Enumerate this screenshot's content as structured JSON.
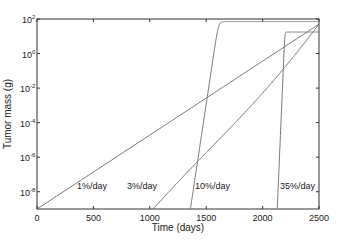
{
  "chart_data": {
    "type": "line",
    "title": "",
    "xlabel": "Time (days)",
    "ylabel": "Tumor mass (g)",
    "xlim": [
      0,
      2500
    ],
    "ylim_log10": [
      -9,
      2
    ],
    "yscale": "log",
    "grid": false,
    "legend": "none (inline curve labels)",
    "x_ticks": [
      0,
      500,
      1000,
      1500,
      2000,
      2500
    ],
    "x_tick_labels": [
      "0",
      "500",
      "1000",
      "1500",
      "2000",
      "2500"
    ],
    "y_ticks_log10": [
      2,
      0,
      -2,
      -4,
      -6,
      -8
    ],
    "y_tick_labels": [
      {
        "base": "10",
        "exp": "2"
      },
      {
        "base": "10",
        "exp": "0"
      },
      {
        "base": "10",
        "exp": "-2"
      },
      {
        "base": "10",
        "exp": "-4"
      },
      {
        "base": "10",
        "exp": "-6"
      },
      {
        "base": "10",
        "exp": "-8"
      }
    ],
    "series": [
      {
        "name": "1%/day",
        "rate_per_day": 0.01,
        "start_day": 0,
        "start_log10_mass": -9,
        "end_day": 2500,
        "end_log10_mass": 1.7,
        "color": "#555555"
      },
      {
        "name": "3%/day",
        "rate_per_day": 0.03,
        "start_day": 1030,
        "start_log10_mass": -9,
        "end_day": 2500,
        "end_log10_mass": 1.7,
        "color": "#666666"
      },
      {
        "name": "10%/day",
        "rate_per_day": 0.1,
        "start_day": 1360,
        "start_log10_mass": -9,
        "end_day": 2500,
        "end_log10_mass": 1.75,
        "color": "#777777"
      },
      {
        "name": "35%/day",
        "rate_per_day": 0.35,
        "start_day": 2130,
        "start_log10_mass": -9,
        "end_day": 2500,
        "end_log10_mass": 1.2,
        "color": "#777777"
      }
    ],
    "annotations": [
      "1%/day",
      "3%/day",
      "10%/day",
      "35%/day"
    ]
  }
}
